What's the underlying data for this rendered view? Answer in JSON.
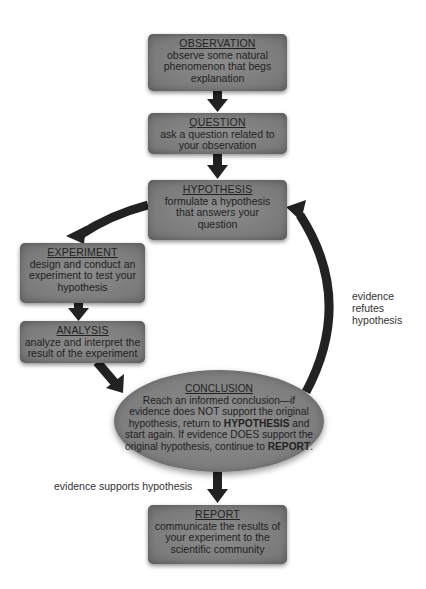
{
  "diagram": {
    "steps": {
      "observation": {
        "title": "OBSERVATION",
        "body": "observe some natural phenomenon that begs explanation"
      },
      "question": {
        "title": "QUESTION",
        "body": "ask a question related to your observation"
      },
      "hypothesis": {
        "title": "HYPOTHESIS",
        "body": "formulate a hypothesis that answers your question"
      },
      "experiment": {
        "title": "EXPERIMENT",
        "body": "design and conduct an experiment to test your hypothesis"
      },
      "analysis": {
        "title": "ANALYSIS",
        "body": "analyze and interpret the result of the experiment"
      },
      "conclusion": {
        "title": "CONCLUSION",
        "body_part1": "Reach an informed conclusion—if evidence does NOT support the original hypothesis, return to ",
        "body_bold1": "HYPOTHESIS",
        "body_part2": " and start again. If evidence DOES support the original hypothesis, continue to ",
        "body_bold2": "REPORT",
        "body_part3": "."
      },
      "report": {
        "title": "REPORT",
        "body": "communicate the results of your experiment to the scientific community"
      }
    },
    "edge_labels": {
      "refutes": "evidence refutes hypothesis",
      "refutes_lines": [
        "evidence",
        "refutes",
        "hypothesis"
      ],
      "supports": "evidence supports hypothesis"
    },
    "colors": {
      "box_fill": "#7f7f7f",
      "arrow": "#222222",
      "text": "#222222",
      "background": "#ffffff"
    }
  }
}
